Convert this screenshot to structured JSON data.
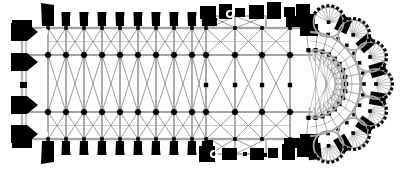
{
  "document": {
    "type": "architectural-floor-plan",
    "title": "Gothic Cathedral Floor Plan",
    "subject": "Notre-Dame de Paris",
    "orientation": "west at left, east (apse) at right",
    "rendering": "black and white line drawing, scanned halftone",
    "background_color": "#ffffff",
    "masonry_color": "#000000",
    "rib_line_color": "#8a8a8a",
    "wall_line_color": "#b5b5b5",
    "width_px": 406,
    "height_px": 170
  },
  "plan_geometry": {
    "west_front": {
      "label": "West Front",
      "x": 26,
      "wall_x": 24,
      "wall_top": 26,
      "wall_bottom": 142,
      "buttress_count": 4,
      "buttress_ys": [
        32,
        62,
        105,
        134
      ],
      "buttress_width": 22,
      "buttress_height": 17
    },
    "nave": {
      "label": "Nave",
      "x_start": 44,
      "x_end": 206,
      "bay_count": 10,
      "bay_xs": [
        48,
        66,
        84,
        102,
        120,
        138,
        156,
        174,
        192,
        206
      ],
      "pier_rows_y": [
        28,
        55,
        112,
        139
      ],
      "aisle_count": 2,
      "buttress_top_count": 10,
      "buttress_bottom_count": 10,
      "buttress_width": 8,
      "buttress_height": 16
    },
    "transept": {
      "label": "Transept",
      "x_start": 206,
      "x_end": 300,
      "north_projection_top": 8,
      "south_projection_bottom": 162,
      "pier_cols_x": [
        206,
        235,
        262,
        290
      ],
      "pier_rows_y": [
        28,
        55,
        85,
        112,
        139
      ]
    },
    "crossing": {
      "label": "Crossing",
      "center_x": 248,
      "center_y": 84
    },
    "choir": {
      "label": "Choir",
      "x_start": 262,
      "x_end": 310
    },
    "chevet": {
      "label": "Chevet / Apse with Ambulatory",
      "center_x": 312,
      "center_y": 84,
      "inner_radius": 34,
      "ambulatory_radius": 52,
      "chapel_ring_radius": 64,
      "radiating_chapel_count": 7,
      "chapel_radius": 15,
      "chapel_angles_deg": [
        -75,
        -50,
        -25,
        0,
        25,
        50,
        75
      ]
    }
  },
  "annotations": {
    "stair_turret_marks": 4,
    "stair_turret_positions": [
      {
        "x": 44,
        "y": 32
      },
      {
        "x": 44,
        "y": 134
      },
      {
        "x": 230,
        "y": 14
      },
      {
        "x": 214,
        "y": 154
      }
    ]
  },
  "legend": {
    "visible": false,
    "caption": ""
  }
}
